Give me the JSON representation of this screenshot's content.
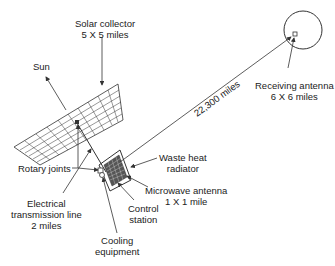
{
  "diagram": {
    "labels": {
      "solar_collector": [
        "Solar collector",
        "5 X 5 miles"
      ],
      "sun": "Sun",
      "distance": "22,300 miles",
      "receiving_antenna": [
        "Receiving antenna",
        "6 X 6 miles"
      ],
      "rotary_joints": "Rotary joints",
      "waste_heat_radiator": [
        "Waste heat",
        "radiator"
      ],
      "microwave_antenna": [
        "Microwave antenna",
        "1 X 1 mile"
      ],
      "electrical_line": [
        "Electrical",
        "transmission line",
        "2 miles"
      ],
      "control_station": [
        "Control",
        "station"
      ],
      "cooling_equipment": [
        "Cooling",
        "equipment"
      ]
    },
    "colors": {
      "line": "#333333",
      "text": "#222222",
      "background": "#ffffff"
    }
  }
}
